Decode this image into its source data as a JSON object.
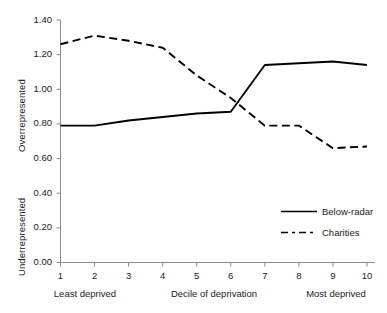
{
  "chart_data": {
    "type": "line",
    "title": "",
    "xlabel": "Decile of deprivation",
    "ylabel_top": "Overrepresented",
    "ylabel_bottom": "Underrepresented",
    "x": [
      1,
      2,
      3,
      4,
      5,
      6,
      7,
      8,
      9,
      10
    ],
    "xtick_labels": [
      "1",
      "2",
      "3",
      "4",
      "5",
      "6",
      "7",
      "8",
      "9",
      "10"
    ],
    "xlim": [
      1,
      10
    ],
    "ylim": [
      0.0,
      1.4
    ],
    "ytick_labels": [
      "0.00",
      "0.20",
      "0.40",
      "0.60",
      "0.80",
      "1.00",
      "1.20",
      "1.40"
    ],
    "ytick_values": [
      0.0,
      0.2,
      0.4,
      0.6,
      0.8,
      1.0,
      1.2,
      1.4
    ],
    "grid": false,
    "legend_position": "lower right",
    "reference_value": 1.0,
    "x_axis_annotations": {
      "left": "Least deprived",
      "center": "Decile of deprivation",
      "right": "Most deprived"
    },
    "series": [
      {
        "name": "Below-radar",
        "style": "solid",
        "color": "#000000",
        "values": [
          0.79,
          0.79,
          0.82,
          0.84,
          0.86,
          0.87,
          1.14,
          1.15,
          1.16,
          1.14
        ]
      },
      {
        "name": "Charities",
        "style": "dashed",
        "color": "#000000",
        "values": [
          1.26,
          1.31,
          1.28,
          1.24,
          1.08,
          0.95,
          0.79,
          0.79,
          0.66,
          0.67
        ]
      }
    ]
  },
  "legend": {
    "items": [
      {
        "label": "Below-radar",
        "style": "solid"
      },
      {
        "label": "Charities",
        "style": "dashed"
      }
    ]
  },
  "axes": {
    "axis_color": "#8a8a8a",
    "text_color": "#1a1a1a"
  }
}
